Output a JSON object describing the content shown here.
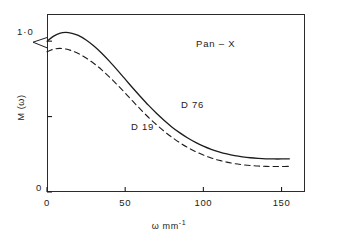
{
  "chart_data": {
    "type": "line",
    "title": "",
    "annotation": "Pan – X",
    "xlabel": "ω mm",
    "xlabel_exponent": "-1",
    "ylabel": "M (ω)",
    "xlim": [
      0,
      165
    ],
    "ylim": [
      0,
      1.18
    ],
    "grid": false,
    "legend_position": "inline-curve-labels",
    "xticks": [
      0,
      50,
      100,
      150
    ],
    "xtick_labels": [
      "0",
      "50",
      "100",
      "150"
    ],
    "yticks": [
      0,
      0.5,
      1.0
    ],
    "ytick_labels": [
      "0",
      "",
      "1·0"
    ],
    "line_color": "#1c1c1c",
    "series": [
      {
        "name": "D 76",
        "style": "solid",
        "x": [
          0,
          4,
          8,
          12,
          16,
          20,
          25,
          30,
          35,
          40,
          45,
          50,
          55,
          60,
          65,
          70,
          75,
          80,
          85,
          90,
          95,
          100,
          105,
          110,
          115,
          120,
          125,
          130,
          135,
          140,
          145,
          150,
          155
        ],
        "y": [
          1.0,
          1.032,
          1.052,
          1.058,
          1.052,
          1.038,
          1.008,
          0.968,
          0.92,
          0.866,
          0.808,
          0.748,
          0.688,
          0.63,
          0.574,
          0.522,
          0.474,
          0.43,
          0.392,
          0.358,
          0.329,
          0.304,
          0.283,
          0.266,
          0.252,
          0.241,
          0.233,
          0.227,
          0.223,
          0.22,
          0.219,
          0.219,
          0.22
        ]
      },
      {
        "name": "D 19",
        "style": "dashed",
        "x": [
          0,
          4,
          8,
          12,
          16,
          20,
          25,
          30,
          35,
          40,
          45,
          50,
          55,
          60,
          65,
          70,
          75,
          80,
          85,
          90,
          95,
          100,
          105,
          110,
          115,
          120,
          125,
          130,
          135,
          140,
          145,
          150,
          155
        ],
        "y": [
          0.93,
          0.946,
          0.952,
          0.948,
          0.936,
          0.918,
          0.888,
          0.852,
          0.81,
          0.762,
          0.71,
          0.656,
          0.6,
          0.546,
          0.494,
          0.446,
          0.402,
          0.362,
          0.326,
          0.295,
          0.268,
          0.245,
          0.226,
          0.21,
          0.198,
          0.188,
          0.181,
          0.176,
          0.172,
          0.17,
          0.169,
          0.169,
          0.17
        ]
      }
    ]
  }
}
